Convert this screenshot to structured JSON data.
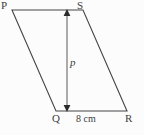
{
  "figure": {
    "type": "parallelogram",
    "shape_name": "PQRS",
    "stroke_color": "#454545",
    "background_color": "#fcfcfc",
    "text_color": "#3d3d3d",
    "vertices": [
      {
        "name": "P",
        "label": "P",
        "x": 12,
        "y": 10
      },
      {
        "name": "S",
        "label": "S",
        "x": 83,
        "y": 10
      },
      {
        "name": "R",
        "label": "R",
        "x": 127,
        "y": 111
      },
      {
        "name": "Q",
        "label": "Q",
        "x": 56,
        "y": 111
      }
    ],
    "height_segment": {
      "label": "p",
      "semantic": "perpendicular-height",
      "x": 67,
      "y_top": 10,
      "y_bottom": 111,
      "arrow_both_ends": true
    },
    "base_measure": {
      "label": "8 cm",
      "value": 8,
      "unit": "cm",
      "along_edge": "QR"
    }
  }
}
